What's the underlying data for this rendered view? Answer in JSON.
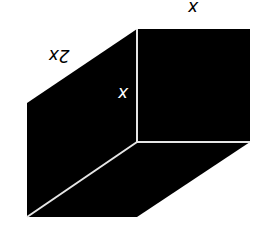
{
  "diagram": {
    "orientation": "rotated 180 degrees",
    "colors": {
      "face": "#000000",
      "edge": "#e6e6e6",
      "label_dark": "#000000",
      "label_light": "#ffffff",
      "background": "#ffffff"
    },
    "labels": {
      "top_width": "x",
      "depth": "2x",
      "height": "x"
    }
  }
}
